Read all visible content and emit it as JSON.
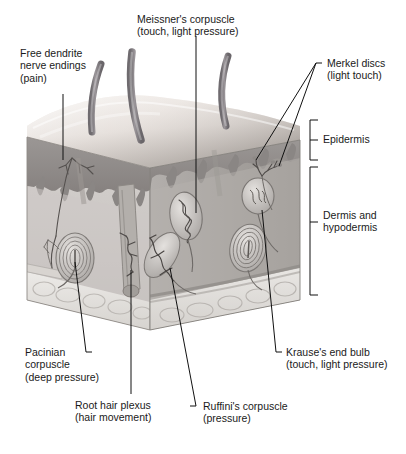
{
  "figure": {
    "background_color": "#ffffff"
  },
  "labels": [
    {
      "id": "free-dendrite",
      "title": "Free dendrite",
      "line2": "nerve endings",
      "line3": "(pain)",
      "text": "Free dendrite\nnerve endings\n(pain)"
    },
    {
      "id": "meissner",
      "title": "Meissner's corpuscle",
      "line2": "(touch, light pressure)",
      "text": "Meissner's corpuscle\n(touch, light pressure)"
    },
    {
      "id": "merkel",
      "title": "Merkel discs",
      "line2": "(light touch)",
      "text": "Merkel discs\n(light touch)"
    },
    {
      "id": "pacinian",
      "title": "Pacinian",
      "line2": "corpuscle",
      "line3": "(deep pressure)",
      "text": "Pacinian\ncorpuscle\n(deep pressure)"
    },
    {
      "id": "root-hair-plexus",
      "title": "Root hair plexus",
      "line2": "(hair movement)",
      "text": "Root hair plexus\n(hair movement)"
    },
    {
      "id": "ruffini",
      "title": "Ruffini's corpuscle",
      "line2": "(pressure)",
      "text": "Ruffini's corpuscle\n(pressure)"
    },
    {
      "id": "krause",
      "title": "Krause's end bulb",
      "line2": "(touch, light pressure)",
      "text": "Krause's end bulb\n(touch, light pressure)"
    }
  ],
  "layer_brackets": [
    {
      "id": "epidermis",
      "text": "Epidermis"
    },
    {
      "id": "dermis-hypodermis",
      "text": "Dermis and\nhypodermis"
    }
  ],
  "colors": {
    "leader_line": "#101010",
    "bracket": "#101010",
    "text": "#1a1a1a",
    "skin_surface_light": "#efeae6",
    "skin_surface_shadow": "#b9b3ae",
    "epidermis_band": "#8e8a88",
    "dermis_face": "#c9c5c2",
    "dermis_face_right": "#a9a5a2",
    "hypodermis_fat": "#e8e5e2",
    "hair_shaft": "#8f8b8e",
    "nerve": "#6e6a6c"
  }
}
